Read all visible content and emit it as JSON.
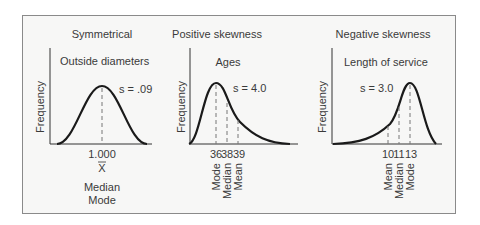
{
  "panels": [
    {
      "title": "Symmetrical",
      "subtitle": "Outside diameters",
      "ylabel": "Frequency",
      "s_label": "s = .09",
      "ticks": [
        "1.000"
      ],
      "xbar": "X",
      "stats": [
        "Median",
        "Mode"
      ]
    },
    {
      "title": "Positive skewness",
      "subtitle": "Ages",
      "ylabel": "Frequency",
      "s_label": "s = 4.0",
      "ticks": [
        "36",
        "38",
        "39"
      ],
      "stats": [
        "Mode",
        "Median",
        "Mean"
      ]
    },
    {
      "title": "Negative skewness",
      "subtitle": "Length of service",
      "ylabel": "Frequency",
      "s_label": "s = 3.0",
      "ticks": [
        "10",
        "11",
        "13"
      ],
      "stats": [
        "Mean",
        "Median",
        "Mode"
      ]
    }
  ],
  "colors": {
    "curve": "#1a1a1a",
    "dash": "#777777",
    "frame": "#8a8a8a",
    "bg": "#f7f7f6"
  }
}
